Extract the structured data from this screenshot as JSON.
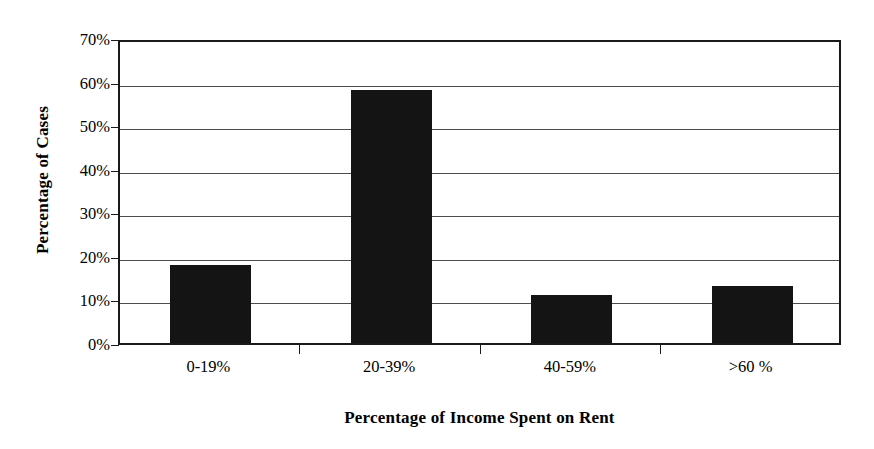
{
  "chart_data": {
    "type": "bar",
    "title": "",
    "categories": [
      "0-19%",
      "20-39%",
      "40-59%",
      ">60 %"
    ],
    "values": [
      18,
      58,
      11,
      13
    ],
    "xlabel": "Percentage of Income Spent on Rent",
    "ylabel": "Percentage of Cases",
    "ylim": [
      0,
      70
    ],
    "ytick_labels": [
      "0%",
      "10%",
      "20%",
      "30%",
      "40%",
      "50%",
      "60%",
      "70%"
    ],
    "ytick_values": [
      0,
      10,
      20,
      30,
      40,
      50,
      60,
      70
    ],
    "grid": "horizontal",
    "legend": "none",
    "bar_color": "#141414",
    "axis_color": "#1a1a1a",
    "grid_color": "#4d4d4d",
    "background_color": "#ffffff"
  },
  "axes": {
    "y_title": "Percentage of Cases",
    "x_title": "Percentage of Income Spent on Rent"
  },
  "ticks": {
    "y": [
      {
        "label": "70%",
        "value": 70
      },
      {
        "label": "60%",
        "value": 60
      },
      {
        "label": "50%",
        "value": 50
      },
      {
        "label": "40%",
        "value": 40
      },
      {
        "label": "30%",
        "value": 30
      },
      {
        "label": "20%",
        "value": 20
      },
      {
        "label": "10%",
        "value": 10
      },
      {
        "label": "0%",
        "value": 0
      }
    ],
    "x": [
      {
        "label": "0-19%",
        "value": 18
      },
      {
        "label": "20-39%",
        "value": 58
      },
      {
        "label": "40-59%",
        "value": 11
      },
      {
        "label": ">60 %",
        "value": 13
      }
    ]
  }
}
